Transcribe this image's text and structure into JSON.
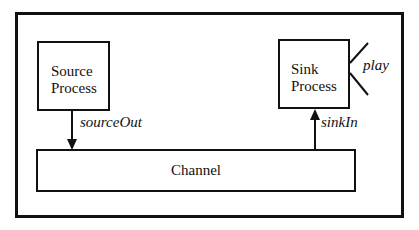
{
  "diagram": {
    "container": {
      "label": ""
    },
    "nodes": [
      {
        "id": "source",
        "label_line1": "Source",
        "label_line2": "Process"
      },
      {
        "id": "sink",
        "label_line1": "Sink",
        "label_line2": "Process"
      },
      {
        "id": "channel",
        "label": "Channel"
      }
    ],
    "edges": [
      {
        "from": "source",
        "to": "channel",
        "label": "sourceOut"
      },
      {
        "from": "channel",
        "to": "sink",
        "label": "sinkIn"
      }
    ],
    "ports": [
      {
        "node": "sink",
        "label": "play"
      }
    ]
  }
}
